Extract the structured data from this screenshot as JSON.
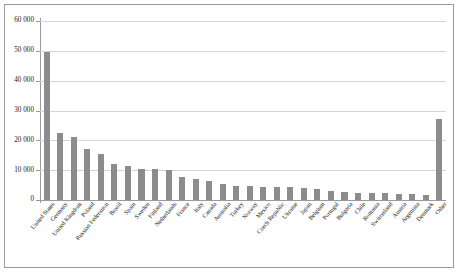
{
  "chart_data": {
    "type": "bar",
    "title": "",
    "subtitle": "",
    "xlabel": "",
    "ylabel": "",
    "ylim": [
      0,
      60000
    ],
    "ytick_step": 10000,
    "grid": true,
    "legend": "none",
    "orientation": "vertical",
    "bar_color": "#8c8c8c",
    "y_tick_labels": [
      "60 000",
      "50 000",
      "40 000",
      "30 000",
      "20 000",
      "10 000",
      "0"
    ],
    "y_tick_values": [
      60000,
      50000,
      40000,
      30000,
      20000,
      10000,
      0
    ],
    "categories": [
      "United States",
      "Germany",
      "United Kingdom",
      "Poland",
      "Russian Federation",
      "Brazil",
      "Spain",
      "Sweden",
      "Finland",
      "Netherlands",
      "France",
      "Italy",
      "Canada",
      "Australia",
      "Turkey",
      "Norway",
      "Mexico",
      "Czech Republic",
      "Ukraine",
      "Japan",
      "Belgium",
      "Portugal",
      "Bulgaria",
      "Chile",
      "Romania",
      "Switzerland",
      "Austria",
      "Argentina",
      "Denmark",
      "Other"
    ],
    "values": [
      49600,
      22500,
      21000,
      17000,
      15500,
      12000,
      11500,
      10500,
      10300,
      10100,
      7600,
      7200,
      6300,
      5400,
      4800,
      4600,
      4500,
      4400,
      4300,
      3900,
      3600,
      2900,
      2700,
      2500,
      2300,
      2200,
      2100,
      2000,
      1800,
      27000
    ]
  },
  "figure": {
    "background": "#ffffff",
    "frame_color": "#9a9a9a",
    "grid_color": "#d4d4d4",
    "axis_color": "#9a9a9a"
  }
}
